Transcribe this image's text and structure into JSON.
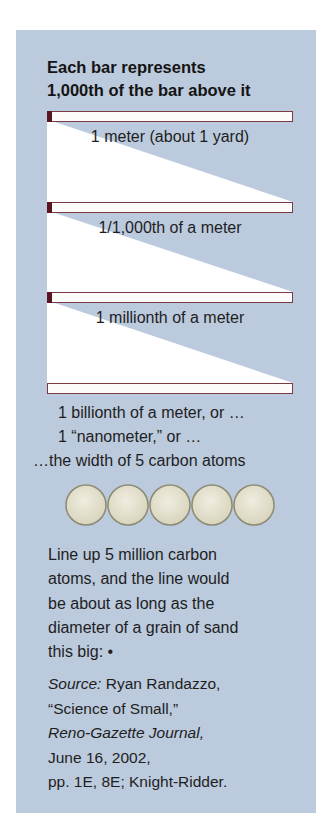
{
  "title": {
    "line1": "Each bar represents",
    "line2": "1,000th of the bar above it"
  },
  "bars": [
    {
      "label": "1 meter (about 1 yard)",
      "top": 111,
      "marker": true
    },
    {
      "label": "1/1,000th of a meter",
      "top": 202,
      "marker": true
    },
    {
      "label": "1 millionth of a meter",
      "top": 292,
      "marker": true
    },
    {
      "label": "",
      "top": 383,
      "marker": false
    }
  ],
  "nanometer": {
    "line1": "1 billionth of a meter, or …",
    "line2": "1 “nanometer,” or …",
    "line3": "…the width of 5 carbon atoms"
  },
  "atoms": {
    "count": 5,
    "label": "carbon-atom"
  },
  "paragraph": {
    "lines": [
      "Line up 5 million carbon",
      "atoms, and the line would",
      "be about as long as the",
      "diameter of a grain of sand",
      "this big: •"
    ]
  },
  "source": {
    "label": "Source:",
    "author": " Ryan Randazzo,",
    "article": "“Science of Small,”",
    "publication": "Reno-Gazette Journal,",
    "date": "June 16, 2002,",
    "pages": "pp. 1E, 8E; Knight-Ridder."
  },
  "colors": {
    "panel_bg": "#bccadd",
    "bar_fill": "#fdfafa",
    "bar_border": "#7a3a44",
    "bar_marker": "#5a1620",
    "wedge": "#ffffff",
    "atom_fill": "#e4e1cf",
    "atom_border": "#8c8a72"
  }
}
